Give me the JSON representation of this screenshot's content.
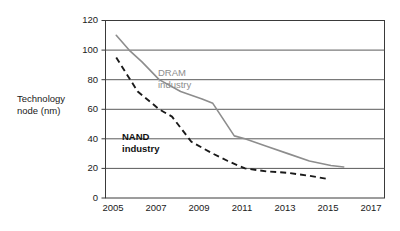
{
  "chart_data": {
    "type": "line",
    "title": "",
    "xlabel": "",
    "ylabel": "Technology node (nm)",
    "xlim": [
      2004.5,
      2017.5
    ],
    "ylim": [
      0,
      120
    ],
    "yticks": [
      0,
      20,
      40,
      60,
      80,
      100,
      120
    ],
    "xticks": [
      2005,
      2007,
      2009,
      2011,
      2013,
      2015,
      2017
    ],
    "grid": "horizontal",
    "legend_position": "inline-annotations",
    "series": [
      {
        "name": "DRAM industry",
        "style": "solid",
        "color": "#8d8d8d",
        "x": [
          2005,
          2005.6,
          2006.2,
          2007,
          2008,
          2009,
          2009.5,
          2010.5,
          2011,
          2012,
          2013,
          2014,
          2015,
          2015.6
        ],
        "values": [
          110,
          100,
          92,
          80,
          72,
          67,
          64,
          42,
          40,
          35,
          30,
          25,
          22,
          21
        ]
      },
      {
        "name": "NAND industry",
        "style": "dashed",
        "color": "#1a1a1a",
        "x": [
          2005,
          2006,
          2007,
          2007.6,
          2008.5,
          2009.5,
          2010.2,
          2011,
          2012,
          2013,
          2014,
          2014.8
        ],
        "values": [
          95,
          72,
          60,
          55,
          38,
          30,
          25,
          20,
          18,
          17,
          15,
          13
        ]
      }
    ],
    "annotations": [
      {
        "text": "DRAM\nindustry",
        "series": "DRAM industry",
        "color": "#8d8d8d",
        "bold": false
      },
      {
        "text": "NAND\nindustry",
        "series": "NAND industry",
        "color": "#1a1a1a",
        "bold": true
      }
    ]
  },
  "axes": {
    "ylabel_text": "Technology\nnode (nm)",
    "ytick_labels": [
      "120",
      "100",
      "80",
      "60",
      "40",
      "20",
      "0"
    ],
    "xtick_labels": [
      "2005",
      "2007",
      "2009",
      "2011",
      "2013",
      "2015",
      "2017"
    ]
  },
  "labels": {
    "dram": "DRAM\nindustry",
    "nand": "NAND\nindustry"
  },
  "colors": {
    "dram_line": "#8d8d8d",
    "nand_line": "#1a1a1a",
    "axis": "#3a3a3a",
    "grid": "#5a5a5a",
    "background": "#ffffff"
  }
}
